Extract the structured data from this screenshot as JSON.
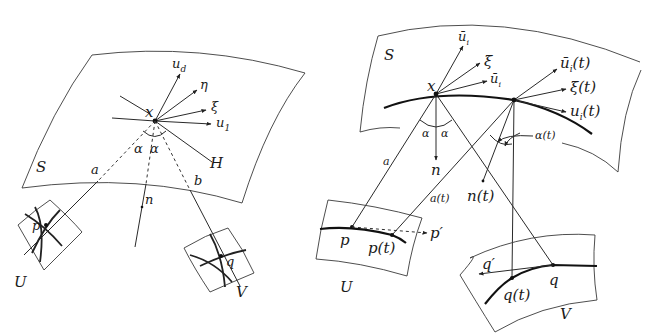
{
  "left_figure": {
    "surface_label": "S",
    "point_x": "x",
    "vectors": {
      "u_d": "u",
      "u_d_sub": "d",
      "eta": "η",
      "xi": "ξ",
      "u_1": "u",
      "u_1_sub": "1",
      "H": "H"
    },
    "angle_left": "α",
    "angle_right": "α",
    "ray_a": "a",
    "ray_b": "b",
    "normal_n": "n",
    "patch_U": "U",
    "patch_V": "V",
    "point_p": "p",
    "point_q": "q"
  },
  "right_figure": {
    "surface_label": "S",
    "point_x": "x",
    "vectors": {
      "u_bar_i_top": "ū",
      "u_bar_i_top_sub": "i",
      "xi": "ξ",
      "u_bar_i_tangent": "ū",
      "u_bar_i_tangent_sub": "i",
      "u_bar_i_t": "ū",
      "u_bar_i_t_sub": "i",
      "u_bar_i_t_arg": "(t)",
      "xi_t": "ξ(t)",
      "u_i_t": "u",
      "u_i_t_sub": "i",
      "u_i_t_arg": "(t)"
    },
    "angle_left": "α",
    "angle_right": "α",
    "angle_t": "α(t)",
    "ray_a": "a",
    "ray_a_t": "a(t)",
    "normal_n": "n",
    "normal_n_t": "n(t)",
    "patch_U": "U",
    "patch_V": "V",
    "point_p": "p",
    "point_p_t": "p(t)",
    "point_p_prime": "p′",
    "point_q": "q",
    "point_q_t": "q(t)",
    "point_q_prime": "q′"
  }
}
